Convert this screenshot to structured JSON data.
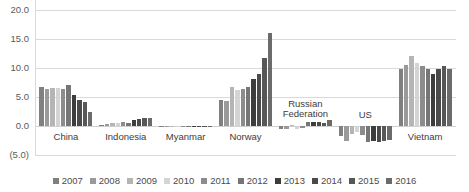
{
  "chart_data": {
    "type": "bar",
    "title": "",
    "subtitle": "",
    "xlabel": "",
    "ylabel": "",
    "ylim": [
      -5.0,
      20.0
    ],
    "y_ticks": [
      "20.0",
      "15.0",
      "10.0",
      "5.0",
      "0.0",
      "(5.0)"
    ],
    "y_tick_values": [
      20.0,
      15.0,
      10.0,
      5.0,
      0.0,
      -5.0
    ],
    "grid": true,
    "legend_position": "bottom",
    "categories": [
      "China",
      "Indonesia",
      "Myanmar",
      "Norway",
      "Russian Federation",
      "US",
      "Vietnam"
    ],
    "series": [
      {
        "name": "2007",
        "color": "#808080",
        "values": [
          6.8,
          0.2,
          0.05,
          4.5,
          -0.5,
          -1.8,
          9.9
        ]
      },
      {
        "name": "2008",
        "color": "#9a9a9a",
        "values": [
          6.4,
          0.4,
          0.05,
          4.3,
          -0.5,
          -2.6,
          10.6
        ]
      },
      {
        "name": "2009",
        "color": "#b5b5b5",
        "values": [
          6.5,
          0.6,
          0.05,
          6.8,
          0.1,
          -1.4,
          12.1
        ]
      },
      {
        "name": "2010",
        "color": "#d4d4d4",
        "values": [
          6.6,
          0.5,
          0.05,
          6.2,
          -0.6,
          -1.1,
          10.9
        ]
      },
      {
        "name": "2011",
        "color": "#8c8c8c",
        "values": [
          6.3,
          0.7,
          0.05,
          6.3,
          -0.4,
          -1.5,
          10.3
        ]
      },
      {
        "name": "2012",
        "color": "#767676",
        "values": [
          7.1,
          0.6,
          0.05,
          6.7,
          0.7,
          -2.7,
          9.8
        ]
      },
      {
        "name": "2013",
        "color": "#3d3d3d",
        "values": [
          5.3,
          1.1,
          0.05,
          8.1,
          0.7,
          -2.6,
          8.9
        ]
      },
      {
        "name": "2014",
        "color": "#4a4a4a",
        "values": [
          4.4,
          1.2,
          0.05,
          9.0,
          0.7,
          -2.8,
          9.9
        ]
      },
      {
        "name": "2015",
        "color": "#575757",
        "values": [
          4.1,
          1.3,
          0.05,
          11.8,
          0.6,
          -2.5,
          10.3
        ]
      },
      {
        "name": "2016",
        "color": "#6b6b6b",
        "values": [
          2.4,
          1.3,
          0.05,
          16.1,
          1.0,
          -2.4,
          9.9
        ]
      }
    ]
  },
  "legend": {
    "items": [
      {
        "label": "2007"
      },
      {
        "label": "2008"
      },
      {
        "label": "2009"
      },
      {
        "label": "2010"
      },
      {
        "label": "2011"
      },
      {
        "label": "2012"
      },
      {
        "label": "2013"
      },
      {
        "label": "2014"
      },
      {
        "label": "2015"
      },
      {
        "label": "2016"
      }
    ]
  },
  "colors": {
    "gridline": "#d9d9d9",
    "tick_text": "#5a5a5a",
    "label_text": "#3c3c3c",
    "background": "#ffffff"
  }
}
